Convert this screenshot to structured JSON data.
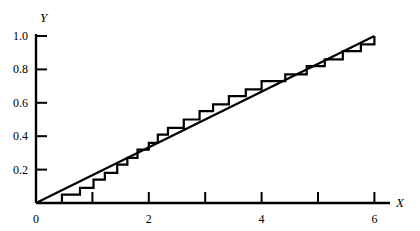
{
  "chart_data": {
    "type": "line",
    "title": "",
    "subtitle": "",
    "xlabel": "X",
    "ylabel": "Y",
    "xlim": [
      0,
      6.3
    ],
    "ylim": [
      0,
      1.05
    ],
    "grid": false,
    "legend": "none",
    "x_ticks": [
      0,
      1,
      2,
      3,
      4,
      5,
      6
    ],
    "x_tick_labels": [
      "0",
      "",
      "2",
      "",
      "4",
      "",
      "6"
    ],
    "y_ticks": [
      0.2,
      0.4,
      0.6,
      0.8,
      1.0
    ],
    "y_tick_labels": [
      "0.2",
      "0.4",
      "0.6",
      "0.8",
      "1.0"
    ],
    "tick_direction": "in",
    "series": [
      {
        "name": "empirical-step-function",
        "type": "step",
        "step_mode": "post",
        "color": "#000000",
        "points": [
          [
            0.0,
            0.0
          ],
          [
            0.46,
            0.0
          ],
          [
            0.46,
            0.05
          ],
          [
            0.78,
            0.05
          ],
          [
            0.78,
            0.09
          ],
          [
            1.02,
            0.09
          ],
          [
            1.02,
            0.14
          ],
          [
            1.22,
            0.14
          ],
          [
            1.22,
            0.18
          ],
          [
            1.44,
            0.18
          ],
          [
            1.44,
            0.23
          ],
          [
            1.62,
            0.23
          ],
          [
            1.62,
            0.27
          ],
          [
            1.8,
            0.27
          ],
          [
            1.8,
            0.32
          ],
          [
            2.0,
            0.32
          ],
          [
            2.0,
            0.36
          ],
          [
            2.16,
            0.36
          ],
          [
            2.16,
            0.41
          ],
          [
            2.34,
            0.41
          ],
          [
            2.34,
            0.45
          ],
          [
            2.62,
            0.45
          ],
          [
            2.62,
            0.5
          ],
          [
            2.9,
            0.5
          ],
          [
            2.9,
            0.55
          ],
          [
            3.14,
            0.55
          ],
          [
            3.14,
            0.59
          ],
          [
            3.42,
            0.59
          ],
          [
            3.42,
            0.64
          ],
          [
            3.72,
            0.64
          ],
          [
            3.72,
            0.68
          ],
          [
            4.0,
            0.68
          ],
          [
            4.0,
            0.73
          ],
          [
            4.42,
            0.73
          ],
          [
            4.42,
            0.77
          ],
          [
            4.8,
            0.77
          ],
          [
            4.8,
            0.82
          ],
          [
            5.12,
            0.82
          ],
          [
            5.12,
            0.86
          ],
          [
            5.44,
            0.86
          ],
          [
            5.44,
            0.91
          ],
          [
            5.76,
            0.91
          ],
          [
            5.76,
            0.95
          ],
          [
            6.0,
            0.95
          ],
          [
            6.0,
            1.0
          ]
        ]
      },
      {
        "name": "reference-diagonal-line",
        "type": "line",
        "color": "#000000",
        "points": [
          [
            0.0,
            0.0
          ],
          [
            6.0,
            1.0
          ]
        ]
      }
    ]
  },
  "axes": {
    "y_axis_label": "Y",
    "x_axis_label": "X"
  }
}
